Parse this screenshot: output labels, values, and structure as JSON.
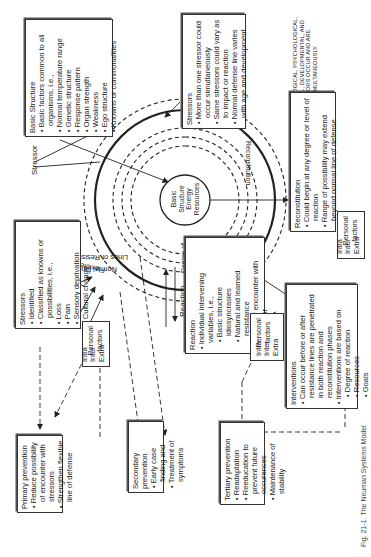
{
  "diagram": {
    "title": "Neuman Systems Model",
    "orientation": "rotated 90 degrees (text reads bottom-to-top)",
    "core": {
      "label_lines": [
        "Basic",
        "Structure",
        "Energy",
        "Resources"
      ]
    },
    "rings": {
      "flexible_line": "Flexible Line of Defense",
      "normal_line": "Normal Line of Defense",
      "lines_of_resistance": "Lines of Resistance",
      "degree_of_reaction": [
        "Degree of",
        "Reaction"
      ],
      "reconstitution_label": "Reconstitution"
    },
    "arrows": {
      "stressor_top": "Stressor",
      "stressor_left": "Stressor",
      "reaction": "Reaction"
    },
    "boxes": {
      "basic_structure": {
        "title": "Basic Structure",
        "items": [
          "Basic factors common to all organisms, i.e.,",
          "Normal temperature range",
          "Genetic structure",
          "Response pattern",
          "Organ strength",
          "Weakness",
          "Ego structure",
          "Knowns or commonalities"
        ]
      },
      "stressors_right": {
        "title": "Stressors",
        "items": [
          "More than one stressor could occur simultaneously",
          "Same stressors could vary as to impact or reaction",
          "Normal defense line varies with age and development"
        ]
      },
      "stressors_left": {
        "title": "Stressors",
        "items": [
          "Identified",
          "Classified as knowns or possibilities, i.e.,",
          "Loss",
          "Pain",
          "Sensory deprivation",
          "Cultural change"
        ]
      },
      "reaction": {
        "title": "Reaction",
        "items": [
          "Individual intervening variables, i.e.,",
          "Basic structure idiosyncrasies",
          "Natural and learned resistance",
          "Time of encounter with stressor"
        ]
      },
      "reconstitution": {
        "title": "Reconstitution",
        "items": [
          "Could begin at any degree or level of reaction",
          "Range of possibility may extend beyond normal line of defense"
        ]
      },
      "interventions": {
        "title": "Interventions",
        "items": [
          "Can occur before or after resistance lines are penetrated in both reaction and reconstitution phases",
          "Interventions are based on",
          "Degree of reaction",
          "Resources",
          "Goals",
          "Anticipated outcome"
        ]
      },
      "primary_prevention": {
        "title": "Primary prevention",
        "items": [
          "Reduce possibility of encounter with stressors",
          "Strengthen flexible line of defense"
        ]
      },
      "secondary_prevention": {
        "title": "Secondary prevention",
        "items": [
          "Early case finding and",
          "Treatment of symptoms"
        ]
      },
      "tertiary_prevention": {
        "title": "Tertiary prevention",
        "items": [
          "Readaptation",
          "Reeducation to prevent future occurences",
          "Maintenance of stability"
        ]
      }
    },
    "personal_factors": {
      "label_lines": [
        "Personal",
        "factors"
      ],
      "items": [
        "Intra",
        "Inter",
        "Extra"
      ]
    },
    "note": "NOTE: PHYSIOLOGICAL, PSYCHOLOGICAL, SOCIOCULTURAL, DEVELOPMENTAL, AND SPIRITUAL FACTORS OCCUR AND ARE CONSIDERED SIMULTANEOUSLY",
    "caption_partial": "Fig. 21-1. The Neuman Systems Model"
  }
}
